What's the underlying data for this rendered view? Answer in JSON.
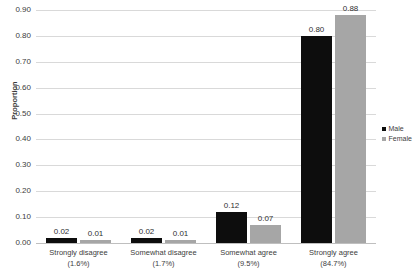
{
  "chart_data": {
    "type": "bar",
    "title": "",
    "xlabel": "",
    "ylabel": "Proportion",
    "ylim": [
      0.0,
      0.9
    ],
    "ytick_labels": [
      "0.90",
      "0.80",
      "0.70",
      "0.60",
      "0.50",
      "0.40",
      "0.30",
      "0.20",
      "0.10",
      "0.00"
    ],
    "ytick_values": [
      0.9,
      0.8,
      0.7,
      0.6,
      0.5,
      0.4,
      0.3,
      0.2,
      0.1,
      0.0
    ],
    "grid": true,
    "legend_position": "right",
    "categories": [
      {
        "label": "Strongly disagree",
        "percent": "(1.6%)"
      },
      {
        "label": "Somewhat disagree",
        "percent": "(1.7%)"
      },
      {
        "label": "Somewhat agree",
        "percent": "(9.5%)"
      },
      {
        "label": "Strongly agree",
        "percent": "(84.7%)"
      }
    ],
    "series": [
      {
        "name": "Male",
        "color": "#0d0d0d",
        "values": [
          0.02,
          0.02,
          0.12,
          0.8
        ],
        "labels": [
          "0.02",
          "0.02",
          "0.12",
          "0.80"
        ]
      },
      {
        "name": "Female",
        "color": "#a6a6a6",
        "values": [
          0.01,
          0.01,
          0.07,
          0.88
        ],
        "labels": [
          "0.01",
          "0.01",
          "0.07",
          "0.88"
        ]
      }
    ]
  }
}
